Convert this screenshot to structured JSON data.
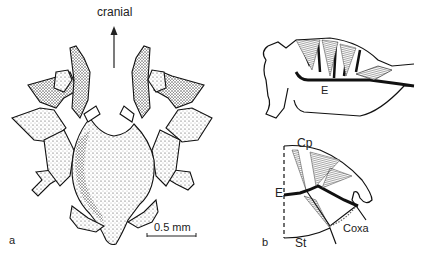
{
  "panel_a": {
    "label": "a",
    "direction_label": "cranial",
    "scale_bar": "0.5 mm"
  },
  "panel_b": {
    "label": "b",
    "upper_label_E": "E",
    "lower_labels": {
      "Cp": "Cp",
      "E": "E",
      "St": "St",
      "Coxa": "Coxa"
    }
  }
}
